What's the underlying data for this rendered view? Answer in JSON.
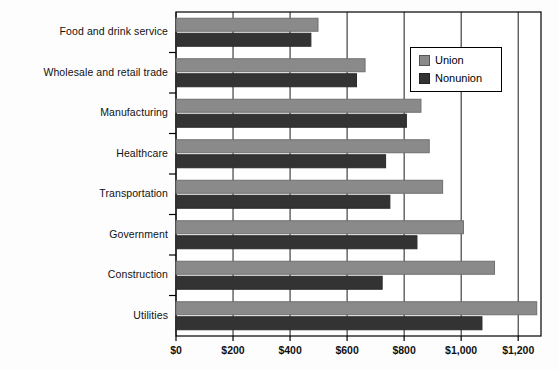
{
  "chart_data": {
    "type": "bar",
    "orientation": "horizontal",
    "title": "",
    "xlabel": "",
    "ylabel": "",
    "xlim": [
      0,
      1280
    ],
    "xticks": [
      0,
      200,
      400,
      600,
      800,
      1000,
      1200
    ],
    "xticklabels": [
      "$0",
      "$200",
      "$400",
      "$600",
      "$800",
      "$1,000",
      "$1,200"
    ],
    "grid": "vertical",
    "legend_position": "upper right",
    "categories": [
      "Food and drink service",
      "Wholesale and retail trade",
      "Manufacturing",
      "Healthcare",
      "Transportation",
      "Government",
      "Construction",
      "Utilities"
    ],
    "series": [
      {
        "name": "Union",
        "color": "#8a8a8a",
        "values": [
          498,
          663,
          859,
          888,
          935,
          1008,
          1117,
          1265
        ]
      },
      {
        "name": "Nonunion",
        "color": "#333333",
        "values": [
          473,
          633,
          808,
          735,
          750,
          845,
          723,
          1073
        ]
      }
    ]
  },
  "legend": {
    "items": [
      {
        "label": "Union",
        "swatch": "union"
      },
      {
        "label": "Nonunion",
        "swatch": "nonunion"
      }
    ]
  }
}
